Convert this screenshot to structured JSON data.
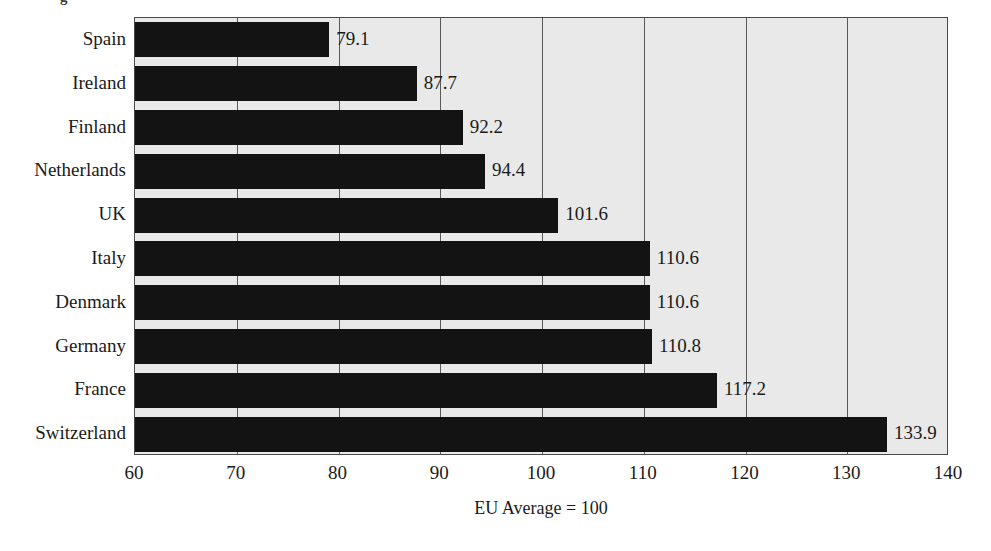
{
  "figure": {
    "title_fragment": "g",
    "axis_caption": "EU Average = 100"
  },
  "chart_data": {
    "type": "bar",
    "orientation": "horizontal",
    "title": "",
    "xlabel": "EU Average = 100",
    "ylabel": "",
    "xlim": [
      60,
      140
    ],
    "xticks": [
      60,
      70,
      80,
      90,
      100,
      110,
      120,
      130,
      140
    ],
    "grid": true,
    "legend": null,
    "bar_color": "#131313",
    "plot_background": "#e9e9e9",
    "categories": [
      "Spain",
      "Ireland",
      "Finland",
      "Netherlands",
      "UK",
      "Italy",
      "Denmark",
      "Germany",
      "France",
      "Switzerland"
    ],
    "values": [
      79.1,
      87.7,
      92.2,
      94.4,
      101.6,
      110.6,
      110.6,
      110.8,
      117.2,
      133.9
    ],
    "data_labels": [
      "79.1",
      "87.7",
      "92.2",
      "94.4",
      "101.6",
      "110.6",
      "110.6",
      "110.8",
      "117.2",
      "133.9"
    ]
  }
}
